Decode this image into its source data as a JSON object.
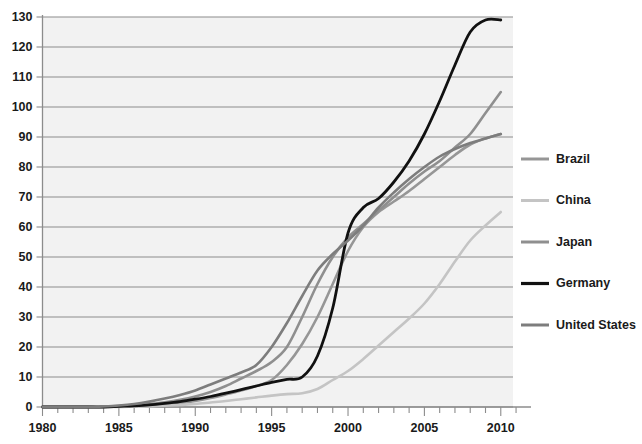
{
  "chart_data": {
    "type": "line",
    "title": "",
    "subtitle": "",
    "xlabel": "",
    "ylabel": "",
    "xlim": [
      1980,
      2010.8
    ],
    "ylim": [
      0,
      130
    ],
    "grid": true,
    "grid_axis": "y",
    "legend_position": "right",
    "x_ticks_major": [
      1980,
      1985,
      1990,
      1995,
      2000,
      2005,
      2010
    ],
    "x_tick_labels": [
      "1980",
      "1985",
      "1990",
      "1995",
      "2000",
      "2005",
      "2010"
    ],
    "x_minor_tick_step": 1,
    "y_ticks": [
      0,
      10,
      20,
      30,
      40,
      50,
      60,
      70,
      80,
      90,
      100,
      110,
      120,
      130
    ],
    "y_tick_labels": [
      "0",
      "10",
      "20",
      "30",
      "40",
      "50",
      "60",
      "70",
      "80",
      "90",
      "100",
      "110",
      "120",
      "130"
    ],
    "x": [
      1980,
      1981,
      1982,
      1983,
      1984,
      1985,
      1986,
      1987,
      1988,
      1989,
      1990,
      1991,
      1992,
      1993,
      1994,
      1995,
      1996,
      1997,
      1998,
      1999,
      2000,
      2001,
      2002,
      2003,
      2004,
      2005,
      2006,
      2007,
      2008,
      2009,
      2010
    ],
    "series": [
      {
        "name": "Brazil",
        "color": "#969696",
        "width": 2.6,
        "values": [
          0,
          0,
          0,
          0,
          0,
          0.2,
          0.4,
          0.6,
          0.9,
          1.3,
          2.0,
          3.0,
          4.2,
          5.5,
          7.0,
          9.0,
          14.0,
          21.0,
          30.0,
          41.0,
          52.0,
          60.0,
          65.0,
          68.5,
          72.0,
          76.0,
          80.0,
          84.0,
          87.5,
          89.5,
          91.0
        ]
      },
      {
        "name": "China",
        "color": "#c4c4c4",
        "width": 2.6,
        "values": [
          0,
          0,
          0,
          0,
          0,
          0,
          0.1,
          0.2,
          0.4,
          0.7,
          1.0,
          1.5,
          2.0,
          2.6,
          3.2,
          3.8,
          4.3,
          4.6,
          6.0,
          9.0,
          12.0,
          16.0,
          20.5,
          25.0,
          29.5,
          34.5,
          41.0,
          48.5,
          55.5,
          60.5,
          65.0
        ]
      },
      {
        "name": "Japan",
        "color": "#8f8f8f",
        "width": 2.6,
        "values": [
          0,
          0,
          0,
          0,
          0.1,
          0.3,
          0.6,
          1.0,
          1.6,
          2.4,
          3.5,
          5.0,
          7.0,
          9.5,
          12.0,
          15.0,
          20.0,
          30.0,
          41.0,
          50.0,
          56.5,
          61.0,
          65.5,
          70.0,
          74.5,
          78.5,
          82.0,
          86.5,
          91.0,
          98.0,
          105.0
        ]
      },
      {
        "name": "Germany",
        "color": "#111111",
        "width": 2.8,
        "values": [
          0,
          0,
          0,
          0,
          0,
          0.2,
          0.4,
          0.7,
          1.2,
          1.8,
          2.6,
          3.5,
          4.6,
          5.8,
          7.0,
          8.2,
          9.2,
          10.0,
          17.0,
          33.0,
          58.0,
          66.5,
          69.5,
          75.0,
          82.0,
          91.0,
          102.0,
          114.0,
          125.0,
          129.0,
          129.0
        ]
      },
      {
        "name": "United States",
        "color": "#7d7d7d",
        "width": 2.6,
        "values": [
          0,
          0,
          0,
          0,
          0.2,
          0.5,
          1.0,
          1.8,
          2.8,
          4.0,
          5.5,
          7.5,
          9.5,
          11.5,
          14.0,
          20.0,
          28.0,
          37.0,
          45.5,
          51.0,
          55.5,
          60.5,
          66.5,
          71.5,
          76.0,
          80.0,
          83.5,
          86.0,
          88.0,
          89.5,
          91.0
        ]
      }
    ],
    "legend": [
      {
        "label": "Brazil",
        "color": "#969696"
      },
      {
        "label": "China",
        "color": "#c4c4c4"
      },
      {
        "label": "Japan",
        "color": "#8f8f8f"
      },
      {
        "label": "Germany",
        "color": "#111111"
      },
      {
        "label": "United States",
        "color": "#7d7d7d"
      }
    ],
    "colors": {
      "plot_background": "#f2f2f2",
      "page_background": "#ffffff",
      "gridline": "#8c8c8c",
      "axis": "#8c8c8c",
      "text": "#1a1a1a"
    }
  }
}
